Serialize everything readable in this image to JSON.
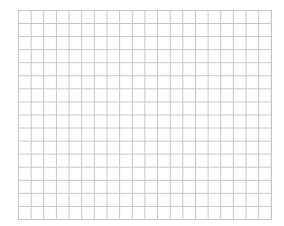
{
  "grid": {
    "columns": 20,
    "rows": 16,
    "line_color": "#c4c4c4",
    "background_color": "#ffffff"
  }
}
